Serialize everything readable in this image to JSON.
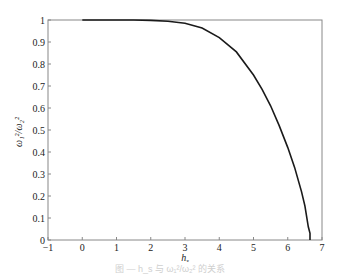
{
  "chart_data": {
    "type": "line",
    "title": "",
    "xlabel": "h_s",
    "ylabel": "ω_1^2/ω_2^2",
    "xlim": [
      -1,
      7
    ],
    "ylim": [
      0,
      1
    ],
    "xticks": [
      -1,
      0,
      1,
      2,
      3,
      4,
      5,
      6,
      7
    ],
    "yticks": [
      0,
      0.1,
      0.2,
      0.3,
      0.4,
      0.5,
      0.6,
      0.7,
      0.8,
      0.9,
      1
    ],
    "xtick_labels": [
      "−1",
      "0",
      "1",
      "2",
      "3",
      "4",
      "5",
      "6",
      "7"
    ],
    "ytick_labels": [
      "0",
      "0.1",
      "0.2",
      "0.3",
      "0.4",
      "0.5",
      "0.6",
      "0.7",
      "0.8",
      "0.9",
      "1"
    ],
    "grid": false,
    "legend": null,
    "series": [
      {
        "name": "ratio",
        "color": "#1a1a1a",
        "x": [
          0,
          0.5,
          1,
          1.5,
          2,
          2.5,
          3,
          3.5,
          4,
          4.5,
          5,
          5.25,
          5.5,
          5.75,
          6,
          6.2,
          6.4,
          6.5,
          6.6,
          6.65,
          6.65
        ],
        "y": [
          1,
          1,
          1,
          1,
          0.998,
          0.994,
          0.985,
          0.963,
          0.92,
          0.855,
          0.75,
          0.685,
          0.61,
          0.52,
          0.42,
          0.33,
          0.22,
          0.155,
          0.06,
          0.03,
          0
        ]
      }
    ]
  },
  "axes": {
    "x_label_main": "h",
    "x_label_sub": "s",
    "y_label_main": "ω",
    "y_label_text": "ω₁²/ω₂²"
  },
  "caption": "图 — h_s 与 ω₁²/ω₂² 的关系"
}
